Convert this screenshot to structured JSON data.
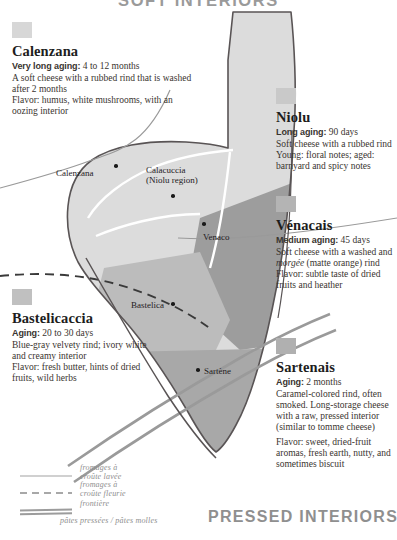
{
  "titles": {
    "top": "SOFT INTERIORS",
    "bottom": "PRESSED INTERIORS"
  },
  "colors": {
    "swatch_calenzana": "#d7d7d7",
    "swatch_niolu": "#c9c9c9",
    "swatch_venacais": "#b4b4b4",
    "swatch_bastelicaccia": "#c0c0c0",
    "swatch_sartenais": "#b0b0b0",
    "region_niolu": "#dcdcdc",
    "region_calenzana": "#d9d9d9",
    "region_venaco": "#9d9d9d",
    "region_bastelica": "#bcbcbc",
    "region_sartene": "#a8a8a8",
    "outline": "#595455",
    "border_line": "#9a9a9a",
    "title_gray": "#9a9a9a"
  },
  "cheeses": [
    {
      "id": "calenzana",
      "name": "Calenzana",
      "aging_label": "Very long aging:",
      "aging_value": "4 to 12 months",
      "description": "A soft cheese with a rubbed rind that is washed after 2 months",
      "flavor": "Flavor: humus, white mushrooms, with an oozing interior"
    },
    {
      "id": "niolu",
      "name": "Niolu",
      "aging_label": "Long aging:",
      "aging_value": "90 days",
      "description": "Soft cheese with a rubbed rind",
      "flavor": "Young: floral notes; aged: barnyard and spicy notes"
    },
    {
      "id": "venacais",
      "name": "Vénacais",
      "aging_label": "Medium aging:",
      "aging_value": "45 days",
      "description_pre": "Soft cheese with a washed and ",
      "description_em": "morgée",
      "description_post": " (matte orange) rind",
      "flavor": "Flavor: subtle taste of dried fruits and heather"
    },
    {
      "id": "bastelicaccia",
      "name": "Bastelicaccia",
      "aging_label": "Aging:",
      "aging_value": "20 to 30 days",
      "description": "Blue-gray velvety rind; ivory white and creamy interior",
      "flavor": "Flavor: fresh butter, hints of dried fruits, wild herbs"
    },
    {
      "id": "sartenais",
      "name": "Sartenais",
      "aging_label": "Aging:",
      "aging_value": "2 months",
      "description": "Caramel-colored rind, often smoked. Long-storage cheese with a raw, pressed interior (similar to tomme cheese)",
      "flavor": "Flavor: sweet, dried-fruit aromas, fresh earth, nutty, and sometimes biscuit"
    }
  ],
  "places": [
    {
      "id": "calenzana",
      "label": "Calenzana",
      "sub": ""
    },
    {
      "id": "calacuccia",
      "label": "Calacuccia",
      "sub": "(Niolu region)"
    },
    {
      "id": "venaco",
      "label": "Venaco",
      "sub": ""
    },
    {
      "id": "bastelica",
      "label": "Bastelica",
      "sub": ""
    },
    {
      "id": "sartene",
      "label": "Sartène",
      "sub": ""
    }
  ],
  "legend": [
    {
      "id": "croute-lavee",
      "key": "solid-thin-line",
      "line1": "fromages à",
      "line2": "croûte lavée"
    },
    {
      "id": "croute-fleurie",
      "key": "dashed-line",
      "line1": "fromages à",
      "line2": "croûte fleurie"
    },
    {
      "id": "frontiere",
      "key": "double-thick-line",
      "line1": "frontière",
      "line2": ""
    },
    {
      "id": "pates",
      "key": "",
      "line1": "pâtes pressées / pâtes molles",
      "line2": ""
    }
  ]
}
